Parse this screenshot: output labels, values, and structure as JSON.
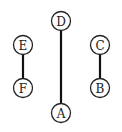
{
  "diagram": {
    "type": "graph",
    "nodes": [
      {
        "id": "D",
        "label": "D",
        "x": 61,
        "y": 21
      },
      {
        "id": "A",
        "label": "A",
        "x": 61,
        "y": 113
      },
      {
        "id": "E",
        "label": "E",
        "x": 23,
        "y": 45
      },
      {
        "id": "F",
        "label": "F",
        "x": 23,
        "y": 88
      },
      {
        "id": "C",
        "label": "C",
        "x": 100,
        "y": 45
      },
      {
        "id": "B",
        "label": "B",
        "x": 100,
        "y": 88
      }
    ],
    "edges": [
      {
        "from": "D",
        "to": "A"
      },
      {
        "from": "E",
        "to": "F"
      },
      {
        "from": "C",
        "to": "B"
      }
    ]
  }
}
